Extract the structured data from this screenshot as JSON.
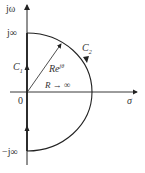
{
  "diagram": {
    "type": "Nyquist contour (s-plane)",
    "axes": {
      "vertical_label": "jω",
      "horizontal_label": "σ",
      "origin_label": "0"
    },
    "points": {
      "top_label": "j∞",
      "bottom_label": "−j∞"
    },
    "paths": {
      "c1_label": "C",
      "c1_sub": "1",
      "c2_label": "C",
      "c2_sub": "2"
    },
    "radius": {
      "label": "Re",
      "exponent": "jθ",
      "limit": "R → ∞"
    },
    "colors": {
      "stroke": "#222222",
      "background": "#ffffff"
    }
  }
}
